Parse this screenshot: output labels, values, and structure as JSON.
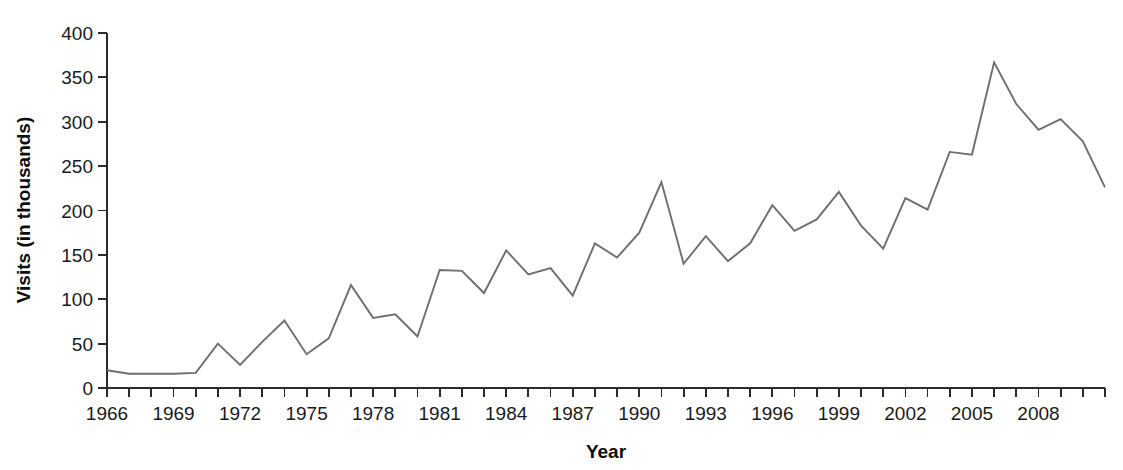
{
  "figure": {
    "width": 1123,
    "height": 470,
    "background": "#ffffff",
    "line_color": "#6e6e6e",
    "axis_color": "#2b2b2b",
    "text_color": "#1a1a1a"
  },
  "axes": {
    "plot_left": 107,
    "plot_right": 1105,
    "plot_top": 33,
    "plot_bottom": 388,
    "y_title": "Visits (in thousands)",
    "x_title": "Year",
    "y_ticks": [
      0,
      50,
      100,
      150,
      200,
      250,
      300,
      350,
      400
    ],
    "y_tick_labels": [
      "0",
      "50",
      "100",
      "150",
      "200",
      "250",
      "300",
      "350",
      "400"
    ],
    "x_tick_years": [
      1966,
      1967,
      1968,
      1969,
      1970,
      1971,
      1972,
      1973,
      1974,
      1975,
      1976,
      1977,
      1978,
      1979,
      1980,
      1981,
      1982,
      1983,
      1984,
      1985,
      1986,
      1987,
      1988,
      1989,
      1990,
      1991,
      1992,
      1993,
      1994,
      1995,
      1996,
      1997,
      1998,
      1999,
      2000,
      2001,
      2002,
      2003,
      2004,
      2005,
      2006,
      2007,
      2008,
      2009,
      2010,
      2011
    ],
    "x_labeled_years": [
      1966,
      1969,
      1972,
      1975,
      1978,
      1981,
      1984,
      1987,
      1990,
      1993,
      1996,
      1999,
      2002,
      2005,
      2008
    ],
    "x_labeled_text": [
      "1966",
      "1969",
      "1972",
      "1975",
      "1978",
      "1981",
      "1984",
      "1987",
      "1990",
      "1993",
      "1996",
      "1999",
      "2002",
      "2005",
      "2008"
    ]
  },
  "chart_data": {
    "type": "line",
    "title": "",
    "subtitle": "",
    "xlabel": "Year",
    "ylabel": "Visits (in thousands)",
    "xlim": [
      1966,
      2011
    ],
    "ylim": [
      0,
      400
    ],
    "grid": false,
    "legend": null,
    "x": [
      1966,
      1967,
      1968,
      1969,
      1970,
      1971,
      1972,
      1973,
      1974,
      1975,
      1976,
      1977,
      1978,
      1979,
      1980,
      1981,
      1982,
      1983,
      1984,
      1985,
      1986,
      1987,
      1988,
      1989,
      1990,
      1991,
      1992,
      1993,
      1994,
      1995,
      1996,
      1997,
      1998,
      1999,
      2000,
      2001,
      2002,
      2003,
      2004,
      2005,
      2006,
      2007,
      2008,
      2009,
      2010,
      2011
    ],
    "values": [
      20,
      16,
      16,
      16,
      17,
      50,
      26,
      52,
      76,
      38,
      56,
      116,
      79,
      83,
      58,
      133,
      132,
      107,
      155,
      128,
      135,
      104,
      163,
      147,
      175,
      232,
      140,
      171,
      143,
      163,
      206,
      177,
      190,
      221,
      183,
      157,
      214,
      201,
      266,
      263,
      367,
      320,
      291,
      303,
      278,
      226
    ],
    "series": [
      {
        "name": "Visits",
        "color": "#6e6e6e",
        "values": [
          20,
          16,
          16,
          16,
          17,
          50,
          26,
          52,
          76,
          38,
          56,
          116,
          79,
          83,
          58,
          133,
          132,
          107,
          155,
          128,
          135,
          104,
          163,
          147,
          175,
          232,
          140,
          171,
          143,
          163,
          206,
          177,
          190,
          221,
          183,
          157,
          214,
          201,
          266,
          263,
          367,
          320,
          291,
          303,
          278,
          226
        ]
      }
    ]
  }
}
